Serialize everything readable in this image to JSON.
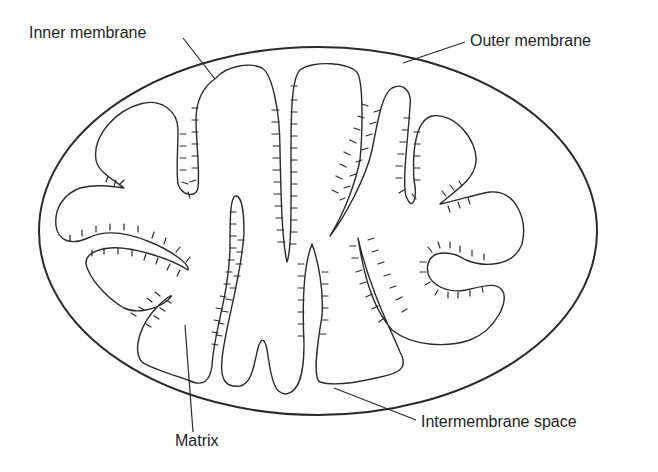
{
  "diagram": {
    "labels": {
      "inner_membrane": "Inner membrane",
      "outer_membrane": "Outer membrane",
      "matrix": "Matrix",
      "intermembrane_space": "Intermembrane space"
    },
    "colors": {
      "stroke": "#2a2a2a",
      "text": "#1e1e1e",
      "background": "#ffffff"
    }
  }
}
